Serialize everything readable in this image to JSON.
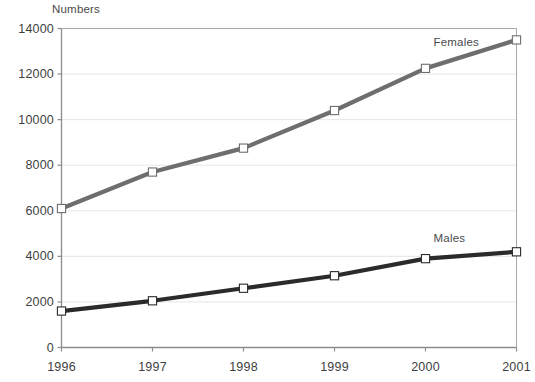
{
  "chart_data": {
    "type": "line",
    "title": "",
    "ylabel": "Numbers",
    "xlabel": "",
    "categories": [
      "1996",
      "1997",
      "1998",
      "1999",
      "2000",
      "2001"
    ],
    "yticks": [
      0,
      2000,
      4000,
      6000,
      8000,
      10000,
      12000,
      14000
    ],
    "ylim": [
      0,
      14000
    ],
    "grid": true,
    "legend_position": "inline-right-of-line-end",
    "series": [
      {
        "name": "Females",
        "color": "#6e6e6e",
        "marker": "square-open",
        "values": [
          6100,
          7700,
          8750,
          10400,
          12250,
          13500
        ]
      },
      {
        "name": "Males",
        "color": "#2b2b2b",
        "marker": "square-open",
        "values": [
          1600,
          2050,
          2600,
          3150,
          3900,
          4200
        ]
      }
    ],
    "annotations": [
      {
        "text": "Females",
        "x": "2000",
        "y": 13350
      },
      {
        "text": "Males",
        "x": "2000",
        "y": 4750
      }
    ]
  },
  "colors": {
    "axis": "#8c8c8c",
    "grid": "#e6e6e6",
    "text": "#3f3f3f",
    "background": "#ffffff"
  }
}
